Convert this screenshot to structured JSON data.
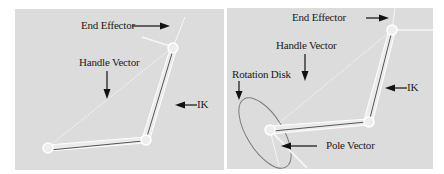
{
  "figure": {
    "panels": [
      {
        "id": "left",
        "labels": {
          "end_effector": "End Effector",
          "handle_vector": "Handle Vector",
          "ik": "IK"
        }
      },
      {
        "id": "right",
        "labels": {
          "end_effector": "End Effector",
          "handle_vector": "Handle Vector",
          "rotation_disk": "Rotation Disk",
          "ik": "IK",
          "pole_vector": "Pole Vector"
        }
      }
    ],
    "colors": {
      "panel_bg": "#dcdcdc",
      "page_bg": "#ffffff",
      "bone": "#ffffff",
      "bone_core": "#555555",
      "arrow": "#111111",
      "disk": "#7a7a7a"
    }
  }
}
